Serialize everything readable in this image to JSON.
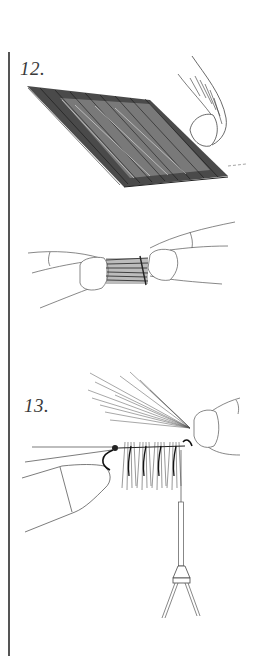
{
  "page": {
    "type": "instructional illustration",
    "background": "#ffffff",
    "ink_color": "#1a1a1a"
  },
  "steps": [
    {
      "number": "12.",
      "figures": [
        {
          "id": "fur-patch",
          "description": "Patch of hair/fur on hide held by fingertip"
        },
        {
          "id": "pinched-fur",
          "description": "Clump of fur pinched between two fingertips"
        }
      ]
    },
    {
      "number": "13.",
      "figures": [
        {
          "id": "fly-on-thread",
          "description": "Hair clumps tied along thread with fingers holding hackle fibers, bobbin hanging below"
        }
      ]
    }
  ]
}
